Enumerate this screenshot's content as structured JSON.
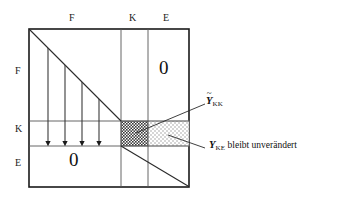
{
  "figure": {
    "column_headers": [
      {
        "label": "F",
        "x": 72,
        "y": 18
      },
      {
        "label": "K",
        "x": 132,
        "y": 18
      },
      {
        "label": "E",
        "x": 166,
        "y": 18
      }
    ],
    "row_headers": [
      {
        "label": "F",
        "x": 17,
        "y": 71
      },
      {
        "label": "K",
        "x": 17,
        "y": 129
      },
      {
        "label": "E",
        "x": 17,
        "y": 163
      }
    ],
    "zeros": [
      {
        "label": "0",
        "x": 162,
        "y": 67
      },
      {
        "label": "0",
        "x": 72,
        "y": 159
      }
    ],
    "annotations": {
      "y_kk": {
        "symbol": "Y",
        "tilde": "~",
        "subscript": "KK",
        "text": ""
      },
      "y_ke": {
        "symbol": "Y",
        "subscript": "KE",
        "text": " bleibt unverändert"
      }
    },
    "blocks": {
      "kk_fill": "#555555",
      "ke_fill": "#d8d8d8"
    },
    "colors": {
      "border": "#1a1a1a",
      "grid": "#555555",
      "text": "#111111"
    }
  }
}
